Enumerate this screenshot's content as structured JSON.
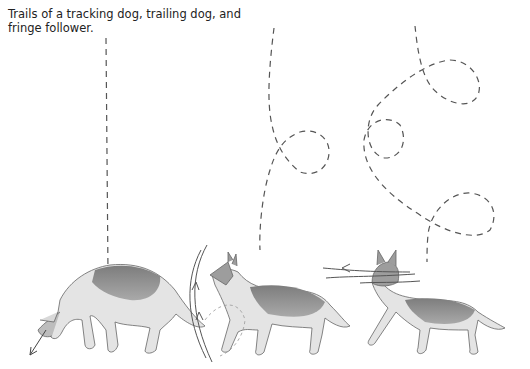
{
  "caption": "Trails of a tracking dog, trailing dog, and fringe follower.",
  "figure": {
    "panels": [
      {
        "id": "tracking",
        "label": "tracking dog",
        "trail": "straight line",
        "pose": "nose to ground"
      },
      {
        "id": "trailing",
        "label": "trailing dog",
        "trail": "mostly straight with one loop",
        "pose": "head raised, scanning arc"
      },
      {
        "id": "fringe",
        "label": "fringe follower",
        "trail": "looping meandering path",
        "pose": "head up, sweeping side to side"
      }
    ],
    "colors": {
      "trail": "#555555",
      "dog_dark": "#8a8a8a",
      "dog_light": "#e2e2e2",
      "outline": "#666666"
    }
  }
}
